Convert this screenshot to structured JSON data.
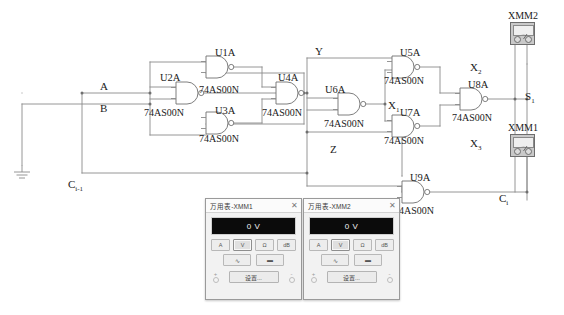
{
  "schematic": {
    "title": "Full adder logic schematic with multimeters",
    "wire_color": "#8a8a8a",
    "gate_stroke": "#6f6f6f",
    "signal_labels": [
      {
        "name": "input-a",
        "text": "A",
        "x": 100,
        "y": 80
      },
      {
        "name": "input-b",
        "text": "B",
        "x": 100,
        "y": 102
      },
      {
        "name": "node-y",
        "text": "Y",
        "x": 315,
        "y": 45
      },
      {
        "name": "node-z",
        "text": "Z",
        "x": 330,
        "y": 143
      },
      {
        "name": "carry-in",
        "text": "C",
        "sub": "i-1",
        "x": 68,
        "y": 178
      },
      {
        "name": "carry-out",
        "text": "C",
        "sub": "i",
        "x": 499,
        "y": 192
      },
      {
        "name": "sum-out",
        "text": "S",
        "sub": "1",
        "x": 525,
        "y": 90
      },
      {
        "name": "node-x1",
        "text": "X",
        "sub": "1",
        "x": 388,
        "y": 99
      },
      {
        "name": "node-x2",
        "text": "X",
        "sub": "2",
        "x": 470,
        "y": 61
      },
      {
        "name": "node-x3",
        "text": "X",
        "sub": "3",
        "x": 470,
        "y": 137
      }
    ],
    "gates": [
      {
        "name": "gate-u1a",
        "ref": "U1A",
        "part": "74AS00N",
        "ref_x": 215,
        "ref_y": 47,
        "part_x": 199,
        "part_y": 84,
        "gx": 206,
        "gy": 56
      },
      {
        "name": "gate-u2a",
        "ref": "U2A",
        "part": "74AS00N",
        "ref_x": 160,
        "ref_y": 72,
        "part_x": 144,
        "part_y": 107,
        "gx": 176,
        "gy": 82
      },
      {
        "name": "gate-u3a",
        "ref": "U3A",
        "part": "74AS00N",
        "ref_x": 215,
        "ref_y": 105,
        "part_x": 199,
        "part_y": 133,
        "gx": 206,
        "gy": 112
      },
      {
        "name": "gate-u4a",
        "ref": "U4A",
        "part": "74AS00N",
        "ref_x": 278,
        "ref_y": 72,
        "part_x": 262,
        "part_y": 107,
        "gx": 276,
        "gy": 82
      },
      {
        "name": "gate-u5a",
        "ref": "U5A",
        "part": "74AS00N",
        "ref_x": 400,
        "ref_y": 47,
        "part_x": 384,
        "part_y": 75,
        "gx": 392,
        "gy": 56
      },
      {
        "name": "gate-u6a",
        "ref": "U6A",
        "part": "74AS00N",
        "ref_x": 325,
        "ref_y": 84,
        "part_x": 324,
        "part_y": 118,
        "gx": 338,
        "gy": 93
      },
      {
        "name": "gate-u7a",
        "ref": "U7A",
        "part": "74AS00N",
        "ref_x": 400,
        "ref_y": 107,
        "part_x": 384,
        "part_y": 135,
        "gx": 392,
        "gy": 115
      },
      {
        "name": "gate-u8a",
        "ref": "U8A",
        "part": "74AS00N",
        "ref_x": 468,
        "ref_y": 79,
        "part_x": 452,
        "part_y": 112,
        "gx": 460,
        "gy": 88
      },
      {
        "name": "gate-u9a",
        "ref": "U9A",
        "part": "74AS00N",
        "ref_x": 410,
        "ref_y": 172,
        "part_x": 394,
        "part_y": 205,
        "gx": 402,
        "gy": 181
      }
    ],
    "instruments": [
      {
        "name": "instrument-xmm2",
        "label": "XMM2",
        "label_x": 508,
        "label_y": 10,
        "x": 510,
        "y": 22
      },
      {
        "name": "instrument-xmm1",
        "label": "XMM1",
        "label_x": 508,
        "label_y": 122,
        "x": 510,
        "y": 134
      }
    ]
  },
  "multimeters": [
    {
      "name": "multimeter-xmm1",
      "window_title": "万用表-XMM1",
      "close_label": "✕",
      "display_value": "0 V",
      "mode_buttons": [
        {
          "name": "mode-current-button",
          "label": "A",
          "selected": false
        },
        {
          "name": "mode-voltage-button",
          "label": "V",
          "selected": true
        },
        {
          "name": "mode-resistance-button",
          "label": "Ω",
          "selected": false
        },
        {
          "name": "mode-decibel-button",
          "label": "dB",
          "selected": false
        }
      ],
      "coupling_buttons": [
        {
          "name": "ac-coupling-button",
          "label": "∿",
          "selected": false
        },
        {
          "name": "dc-coupling-button",
          "label": "▬",
          "selected": false
        }
      ],
      "terminal_plus": "+",
      "terminal_minus": "-",
      "settings_label": "设置...",
      "x": 205,
      "y": 198,
      "w": 95,
      "h": 100
    },
    {
      "name": "multimeter-xmm2",
      "window_title": "万用表-XMM2",
      "close_label": "✕",
      "display_value": "0 V",
      "mode_buttons": [
        {
          "name": "mode-current-button",
          "label": "A",
          "selected": false
        },
        {
          "name": "mode-voltage-button",
          "label": "V",
          "selected": true
        },
        {
          "name": "mode-resistance-button",
          "label": "Ω",
          "selected": false
        },
        {
          "name": "mode-decibel-button",
          "label": "dB",
          "selected": false
        }
      ],
      "coupling_buttons": [
        {
          "name": "ac-coupling-button",
          "label": "∿",
          "selected": false
        },
        {
          "name": "dc-coupling-button",
          "label": "▬",
          "selected": false
        }
      ],
      "terminal_plus": "+",
      "terminal_minus": "-",
      "settings_label": "设置...",
      "x": 303,
      "y": 198,
      "w": 95,
      "h": 100
    }
  ]
}
